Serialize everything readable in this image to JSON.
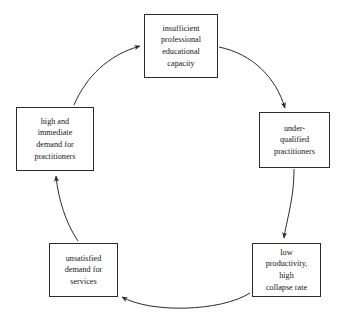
{
  "diagram": {
    "type": "cycle",
    "direction": "clockwise",
    "stroke_color": "#2b2b2b",
    "text_color": "#161616",
    "background_color": "#ffffff",
    "nodes": [
      {
        "id": "insufficient-capacity",
        "label": "insufficient\nprofessional\neducational\ncapacity",
        "position": "top"
      },
      {
        "id": "under-qualified-practitioners",
        "label": "under-\nqualified\npractitioners",
        "position": "right"
      },
      {
        "id": "low-productivity",
        "label": "low\nproductivity,\nhigh\ncollapse rate",
        "position": "bottom-right"
      },
      {
        "id": "unsatisfied-demand",
        "label": "unsatisfied\ndemand for\nservices",
        "position": "bottom-left"
      },
      {
        "id": "high-immediate-demand",
        "label": "high and\nimmediate\ndemand for\npractitioners",
        "position": "left"
      }
    ],
    "edges": [
      {
        "id": "edge-top-to-right",
        "from": "insufficient-capacity",
        "to": "under-qualified-practitioners"
      },
      {
        "id": "edge-right-to-botright",
        "from": "under-qualified-practitioners",
        "to": "low-productivity"
      },
      {
        "id": "edge-botright-to-botleft",
        "from": "low-productivity",
        "to": "unsatisfied-demand"
      },
      {
        "id": "edge-botleft-to-left",
        "from": "unsatisfied-demand",
        "to": "high-immediate-demand"
      },
      {
        "id": "edge-left-to-top",
        "from": "high-immediate-demand",
        "to": "insufficient-capacity"
      }
    ]
  }
}
